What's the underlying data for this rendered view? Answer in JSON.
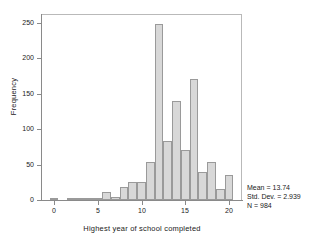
{
  "chart_data": {
    "type": "bar",
    "title": "",
    "xlabel": "Highest year of school completed",
    "ylabel": "Frequency",
    "xlim": [
      -1.5,
      21.5
    ],
    "ylim": [
      0,
      262
    ],
    "grid": false,
    "legend": null,
    "xticks": [
      "0",
      "5",
      "10",
      "15",
      "20"
    ],
    "xtick_values": [
      0,
      5,
      10,
      15,
      20
    ],
    "yticks": [
      "0",
      "50",
      "100",
      "150",
      "200",
      "250"
    ],
    "ytick_values": [
      0,
      50,
      100,
      150,
      200,
      250
    ],
    "bar_width": 1,
    "categories": [
      0,
      1,
      2,
      3,
      4,
      5,
      6,
      7,
      8,
      9,
      10,
      11,
      12,
      13,
      14,
      15,
      16,
      17,
      18,
      19,
      20
    ],
    "values": [
      1,
      0,
      2,
      2,
      1,
      2,
      11,
      4,
      19,
      26,
      26,
      54,
      248,
      83,
      140,
      70,
      170,
      39,
      53,
      16,
      35
    ],
    "annotations": [
      "Mean = 13.74",
      "Std. Dev. = 2.939",
      "N = 984"
    ]
  },
  "stats": {
    "mean": "Mean = 13.74",
    "stddev": "Std. Dev. = 2.939",
    "n": "N = 984"
  },
  "colors": {
    "bar_fill": "#d8d8d8",
    "bar_edge": "#9a9a9a",
    "axis": "#8a8a8a",
    "frame": "#b9b9b9",
    "text": "#1a1a1a",
    "background": "#ffffff"
  }
}
